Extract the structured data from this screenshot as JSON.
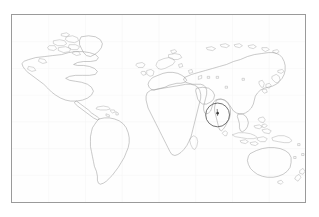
{
  "figure": {
    "kind": "world-outline-map",
    "title": "",
    "caption": "",
    "width_px": 319,
    "height_px": 217,
    "background_color": "#ffffff"
  },
  "map": {
    "projection": "equirectangular",
    "frame": {
      "left_px": 11,
      "top_px": 14,
      "width_px": 295,
      "height_px": 189,
      "border_color": "#9a9a9a",
      "border_width_px": 1,
      "fill_color": "#fefefe"
    },
    "coastline_color": "#9d9d9d",
    "graticule_color": "#f4f4f4",
    "graticule_visible": true,
    "lon_range": [
      -180,
      180
    ],
    "lat_range": [
      -60,
      84
    ],
    "labels_visible": false,
    "landmasses": [
      "North America",
      "Greenland",
      "Canadian Arctic Archipelago",
      "Central America",
      "Caribbean",
      "South America",
      "Europe",
      "Scandinavia",
      "British Isles",
      "Africa",
      "Madagascar",
      "Arabian Peninsula",
      "Asia",
      "India",
      "Sri Lanka",
      "Japan",
      "Korean Peninsula",
      "Southeast Asia",
      "Indonesia",
      "Philippines",
      "New Guinea",
      "Australia",
      "Tasmania",
      "New Zealand"
    ]
  },
  "annotation": {
    "type": "circle-highlight",
    "label": "",
    "region_name": "Bay of Bengal / southern India",
    "center_px": [
      218,
      115
    ],
    "radius_px": 12,
    "stroke_color": "#4a4a4a",
    "stroke_width_px": 0.8,
    "marker": {
      "type": "pin-marker",
      "icon": "map-pin-icon",
      "position_px": [
        218,
        114
      ],
      "color": "#3c3c3c"
    }
  },
  "chart_data": {
    "type": "map",
    "title": "",
    "xlabel": "Longitude",
    "ylabel": "Latitude",
    "xlim": [
      -180,
      180
    ],
    "ylim": [
      -60,
      84
    ],
    "grid": true,
    "legend": "none",
    "annotations": [
      {
        "shape": "circle",
        "lon": 83,
        "lat": 13,
        "radius_deg": 15,
        "text": ""
      },
      {
        "shape": "point",
        "lon": 83,
        "lat": 14,
        "text": ""
      }
    ]
  }
}
